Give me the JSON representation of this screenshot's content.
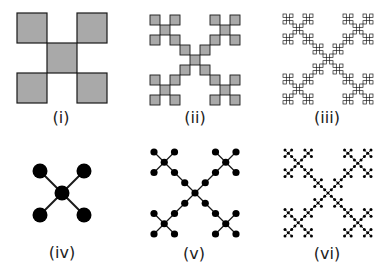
{
  "figure": {
    "background": "#ffffff",
    "square_fill": "#a9a9a9",
    "square_stroke": "#1a1a1a",
    "node_fill": "#000000",
    "edge_color": "#1a1a1a",
    "panels": [
      {
        "id": "i",
        "label": "(i)",
        "kind": "squares",
        "level": 1,
        "x": 17,
        "y": 13,
        "size": 90,
        "label_x": 61,
        "label_y": 110
      },
      {
        "id": "ii",
        "label": "(ii)",
        "kind": "squares",
        "level": 2,
        "x": 150,
        "y": 15,
        "size": 90,
        "label_x": 195,
        "label_y": 110
      },
      {
        "id": "iii",
        "label": "(iii)",
        "kind": "squares",
        "level": 3,
        "x": 283,
        "y": 14,
        "size": 90,
        "label_x": 327,
        "label_y": 110
      },
      {
        "id": "iv",
        "label": "(iv)",
        "kind": "graph",
        "level": 1,
        "x": 40,
        "y": 171,
        "size": 44,
        "node_r": 7.5,
        "edge_w": 2,
        "label_x": 62,
        "label_y": 245
      },
      {
        "id": "v",
        "label": "(v)",
        "kind": "graph",
        "level": 2,
        "x": 154,
        "y": 152,
        "size": 82,
        "node_r": 3.6,
        "edge_w": 1.3,
        "label_x": 194,
        "label_y": 246
      },
      {
        "id": "vi",
        "label": "(vi)",
        "kind": "graph",
        "level": 3,
        "x": 285,
        "y": 150,
        "size": 86,
        "node_r": 1.5,
        "edge_w": 0.8,
        "label_x": 327,
        "label_y": 246
      }
    ]
  }
}
